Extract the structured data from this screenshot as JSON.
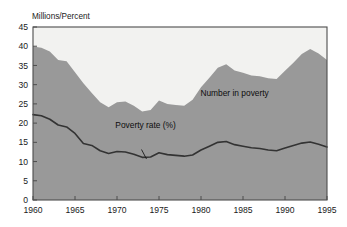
{
  "chart_data": {
    "type": "area",
    "title": "",
    "subtitle": "",
    "xlabel": "",
    "ylabel": "Millions/Percent",
    "xlim": [
      1960,
      1995
    ],
    "ylim": [
      0,
      45
    ],
    "grid": false,
    "legend_position": "inline-annotations",
    "x_ticks": [
      "1960",
      "1965",
      "1970",
      "1975",
      "1980",
      "1985",
      "1990",
      "1995"
    ],
    "x_tick_values": [
      1960,
      1965,
      1970,
      1975,
      1980,
      1985,
      1990,
      1995
    ],
    "y_ticks": [
      "0",
      "5",
      "10",
      "15",
      "20",
      "25",
      "30",
      "35",
      "40",
      "45"
    ],
    "y_tick_values": [
      0,
      5,
      10,
      15,
      20,
      25,
      30,
      35,
      40,
      45
    ],
    "x": [
      1960,
      1961,
      1962,
      1963,
      1964,
      1965,
      1966,
      1967,
      1968,
      1969,
      1970,
      1971,
      1972,
      1973,
      1974,
      1975,
      1976,
      1977,
      1978,
      1979,
      1980,
      1981,
      1982,
      1983,
      1984,
      1985,
      1986,
      1987,
      1988,
      1989,
      1990,
      1991,
      1992,
      1993,
      1994,
      1995
    ],
    "series": [
      {
        "name": "Number in poverty",
        "type": "area",
        "units": "millions",
        "color": "#999999",
        "values": [
          39.9,
          39.6,
          38.6,
          36.4,
          36.1,
          33.2,
          30.4,
          27.8,
          25.4,
          24.1,
          25.4,
          25.6,
          24.5,
          23.0,
          23.4,
          25.9,
          25.0,
          24.7,
          24.5,
          26.1,
          29.3,
          31.8,
          34.4,
          35.3,
          33.7,
          33.1,
          32.4,
          32.2,
          31.7,
          31.5,
          33.6,
          35.7,
          38.0,
          39.3,
          38.1,
          36.4
        ]
      },
      {
        "name": "Poverty rate (%)",
        "type": "line",
        "units": "percent",
        "color": "#333333",
        "values": [
          22.2,
          21.9,
          21.0,
          19.5,
          19.0,
          17.3,
          14.7,
          14.2,
          12.8,
          12.1,
          12.6,
          12.5,
          11.9,
          11.1,
          11.2,
          12.3,
          11.8,
          11.6,
          11.4,
          11.7,
          13.0,
          14.0,
          15.0,
          15.2,
          14.4,
          14.0,
          13.6,
          13.4,
          13.0,
          12.8,
          13.5,
          14.2,
          14.8,
          15.1,
          14.5,
          13.8
        ]
      }
    ],
    "annotations": [
      {
        "text": "Number in poverty",
        "x": 1984.0,
        "y": 27.0
      },
      {
        "text": "Poverty rate (%)",
        "x": 1973.4,
        "y": 18.6
      }
    ]
  },
  "colors": {
    "area_fill": "#999999",
    "plot_background": "#f2f2f0",
    "line": "#333333",
    "frame": "#4d4d4d",
    "text": "#1a1a1a",
    "page_background": "#ffffff"
  }
}
